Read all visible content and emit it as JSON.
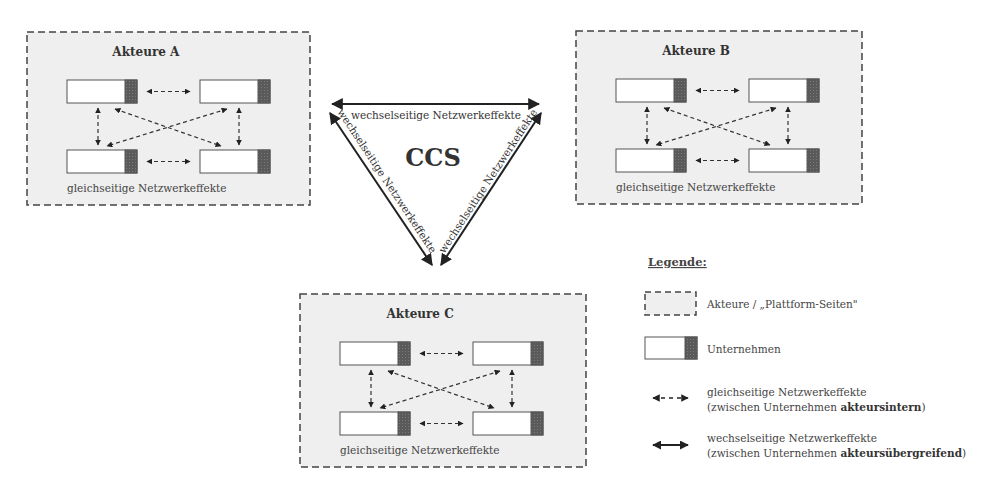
{
  "diagram": {
    "center_label": "CCS",
    "actor_groups": [
      {
        "id": "A",
        "title": "Akteure A",
        "caption": "gleichseitige Netzwerkeffekte"
      },
      {
        "id": "B",
        "title": "Akteure B",
        "caption": "gleichseitige Netzwerkeffekte"
      },
      {
        "id": "C",
        "title": "Akteure C",
        "caption": "gleichseitige Netzwerkeffekte"
      }
    ],
    "triangle_edges": {
      "top": "wechselseitige Netzwerkeffekte",
      "left": "wechselseitige Netzwerkeffekte",
      "right": "wechselseitige Netzwerkeffekte"
    },
    "companies_per_group": 4,
    "colors": {
      "group_fill": "#efefef",
      "group_border": "#444444",
      "company_fill": "#ffffff",
      "company_strip": "#555555",
      "arrow": "#333333"
    }
  },
  "legend": {
    "title": "Legende:",
    "items": [
      {
        "icon": "dashed-box-icon",
        "line1": "Akteure / „Plattform-Seiten\"",
        "line2": "",
        "bold": "",
        "close": ""
      },
      {
        "icon": "company-box-icon",
        "line1": "Unternehmen",
        "line2": "",
        "bold": "",
        "close": ""
      },
      {
        "icon": "dashed-double-arrow-icon",
        "line1": "gleichseitige Netzwerkeffekte",
        "line2": "(zwischen Unternehmen ",
        "bold": "akteursintern",
        "close": ")"
      },
      {
        "icon": "solid-double-arrow-icon",
        "line1": "wechselseitige  Netzwerkeffekte",
        "line2": "(zwischen Unternehmen ",
        "bold": "akteursübergreifend",
        "close": ")"
      }
    ]
  }
}
